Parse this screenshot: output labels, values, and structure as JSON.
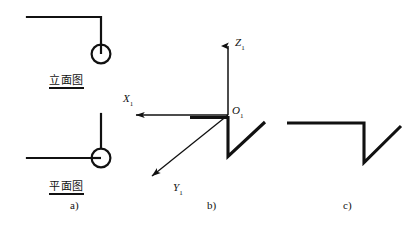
{
  "figure": {
    "background_color": "#ffffff",
    "stroke_color": "#111111",
    "width": 411,
    "height": 226,
    "kind": "orthographic-projection-and-axonometric-diagram"
  },
  "panels": [
    {
      "id": "a",
      "caption": "a)",
      "caption_pos": {
        "x": 70,
        "y": 200
      },
      "views": [
        {
          "id": "elevation",
          "label": "立面图",
          "label_meaning": "elevation-view",
          "label_pos": {
            "x": 49,
            "y": 75
          },
          "geometry": {
            "type": "polyline-with-circle",
            "polyline": [
              [
                27,
                17
              ],
              [
                101,
                17
              ],
              [
                101,
                44
              ]
            ],
            "circle": {
              "cx": 101,
              "cy": 54,
              "r": 9.5
            },
            "circle_tick": [
              [
                101,
                44
              ],
              [
                101,
                54
              ]
            ]
          }
        },
        {
          "id": "plan",
          "label": "平面图",
          "label_meaning": "plan-view",
          "label_pos": {
            "x": 49,
            "y": 181
          },
          "geometry": {
            "type": "polyline-with-circle",
            "polyline": [
              [
                27,
                158
              ],
              [
                92,
                158
              ]
            ],
            "vertical": [
              [
                101,
                114
              ],
              [
                101,
                148
              ]
            ],
            "circle": {
              "cx": 101,
              "cy": 158,
              "r": 9.5
            },
            "circle_tick": [
              [
                92,
                158
              ],
              [
                101,
                158
              ]
            ]
          }
        }
      ]
    },
    {
      "id": "b",
      "caption": "b)",
      "caption_pos": {
        "x": 207,
        "y": 200
      },
      "axes": [
        {
          "name": "Z",
          "subscript": "1",
          "label_pos": {
            "x": 235,
            "y": 37
          },
          "line": [
            [
              228,
              115
            ],
            [
              228,
              42
            ]
          ],
          "arrow_dir": "up"
        },
        {
          "name": "X",
          "subscript": "1",
          "label_pos": {
            "x": 124,
            "y": 93
          },
          "line": [
            [
              228,
              115
            ],
            [
              133,
              115
            ]
          ],
          "arrow_dir": "left"
        },
        {
          "name": "Y",
          "subscript": "1",
          "label_pos": {
            "x": 174,
            "y": 183
          },
          "line": [
            [
              228,
              115
            ],
            [
              150,
              178
            ]
          ],
          "arrow_dir": "down-left"
        }
      ],
      "origin": {
        "name": "O",
        "subscript": "1",
        "label_pos": {
          "x": 232,
          "y": 106
        },
        "point": [
          228,
          115
        ]
      },
      "object": {
        "type": "bold-zigzag",
        "polyline": [
          [
            190,
            117
          ],
          [
            228,
            117
          ],
          [
            228,
            156
          ],
          [
            264,
            123
          ]
        ],
        "stroke_width": 3
      }
    },
    {
      "id": "c",
      "caption": "c)",
      "caption_pos": {
        "x": 343,
        "y": 200
      },
      "object": {
        "type": "bold-zigzag",
        "polyline": [
          [
            287,
            123
          ],
          [
            364,
            123
          ],
          [
            364,
            162
          ],
          [
            400,
            126
          ]
        ],
        "stroke_width": 3
      }
    }
  ],
  "strokes": {
    "thin_width": 1.4,
    "bold_width": 3,
    "circle_width": 2
  }
}
